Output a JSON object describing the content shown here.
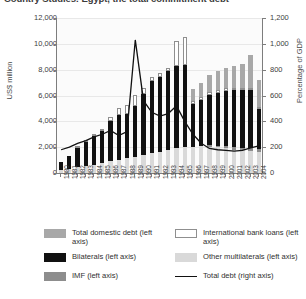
{
  "title": "Country Studies: Egypt, the total commitment debt",
  "chart_data": {
    "type": "bar",
    "title": "Country Studies: Egypt, the total commitment debt",
    "xlabel": "",
    "ylabel": "US$ million",
    "y2label": "Percentage of GDP",
    "ylim": [
      0,
      12000
    ],
    "y2lim": [
      0,
      1200
    ],
    "yticks": [
      "0",
      "2,000",
      "4,000",
      "6,000",
      "8,000",
      "10,000",
      "12,000"
    ],
    "y2ticks": [
      "0",
      "200",
      "400",
      "600",
      "800",
      "1,000",
      "1,200"
    ],
    "grid": true,
    "legend_position": "bottom",
    "stacked": true,
    "categories": [
      "1980",
      "1981",
      "1982",
      "1983",
      "1984",
      "1985",
      "1986",
      "1987",
      "1988",
      "1989",
      "1990",
      "1991",
      "1992",
      "1993",
      "1994",
      "1995",
      "1996",
      "1997",
      "1998",
      "1999",
      "2000",
      "2001",
      "2002",
      "2003",
      "2004"
    ],
    "series": [
      {
        "name": "Other multilaterals (left axis)",
        "axis": "left",
        "color": "#d9d9d9",
        "values": [
          250,
          330,
          430,
          540,
          650,
          780,
          900,
          1020,
          1150,
          1270,
          1400,
          1520,
          1650,
          1780,
          1900,
          2000,
          2050,
          2080,
          2050,
          1980,
          1900,
          1820,
          1750,
          1700,
          1660
        ]
      },
      {
        "name": "IMF (left axis)",
        "axis": "left",
        "color": "#8d8d8d",
        "values": [
          0,
          0,
          0,
          0,
          0,
          0,
          0,
          0,
          0,
          0,
          0,
          0,
          0,
          0,
          0,
          0,
          0,
          0,
          120,
          150,
          170,
          180,
          190,
          200,
          200
        ]
      },
      {
        "name": "Bilaterals (left axis)",
        "axis": "left",
        "color": "#111111",
        "values": [
          600,
          950,
          1500,
          1850,
          2200,
          2500,
          3100,
          3500,
          3400,
          3900,
          4700,
          5600,
          5800,
          6100,
          6400,
          6400,
          3300,
          3600,
          3900,
          4100,
          4300,
          4400,
          4450,
          4500,
          3100
        ]
      },
      {
        "name": "International bank loans (left axis)",
        "axis": "left",
        "color": "#ffffff",
        "values": [
          0,
          0,
          60,
          80,
          100,
          120,
          300,
          520,
          700,
          900,
          500,
          350,
          300,
          280,
          1900,
          2100,
          250,
          220,
          200,
          190,
          180,
          170,
          160,
          150,
          140
        ]
      },
      {
        "name": "Total domestic debt (left axis)",
        "axis": "left",
        "color": "#a8a8a8",
        "values": [
          0,
          0,
          0,
          0,
          0,
          0,
          0,
          0,
          0,
          0,
          0,
          0,
          0,
          0,
          0,
          0,
          900,
          1100,
          1300,
          1450,
          1600,
          1750,
          1900,
          2600,
          2100
        ]
      },
      {
        "name": "Total debt (right axis)",
        "axis": "right",
        "type": "line",
        "color": "#111111",
        "values": [
          180,
          200,
          230,
          250,
          280,
          300,
          330,
          290,
          320,
          1030,
          560,
          470,
          440,
          460,
          520,
          400,
          300,
          230,
          190,
          180,
          175,
          170,
          175,
          195,
          210
        ]
      }
    ]
  },
  "legend": {
    "left_column": [
      {
        "label": "Total domestic debt (left axis)",
        "swatch": "dom"
      },
      {
        "label": "Bilaterals (left axis)",
        "swatch": "bil"
      },
      {
        "label": "IMF (left axis)",
        "swatch": "imf"
      }
    ],
    "right_column": [
      {
        "label": "International bank loans (left axis)",
        "swatch": "ibl"
      },
      {
        "label": "Other multilaterals (left axis)",
        "swatch": "oml"
      },
      {
        "label": "Total debt (right axis)",
        "swatch": "line"
      }
    ]
  }
}
